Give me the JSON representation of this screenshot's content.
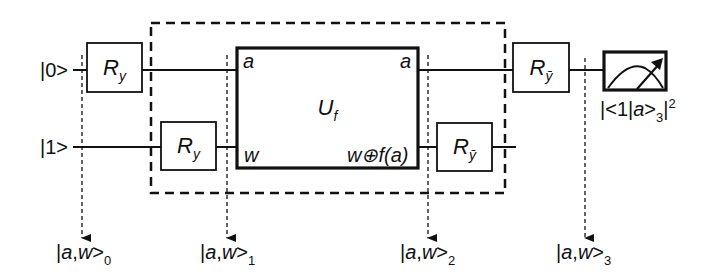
{
  "diagram": {
    "type": "quantum-circuit",
    "inputs": [
      {
        "id": "q0",
        "label": "|0>"
      },
      {
        "id": "q1",
        "label": "|1>"
      }
    ],
    "gates": {
      "ry_top": {
        "base": "R",
        "sub": "y"
      },
      "ry_bottom": {
        "base": "R",
        "sub": "y"
      },
      "uf": {
        "base": "U",
        "sub": "f",
        "in_top": "a",
        "in_bottom": "w",
        "out_top": "a",
        "out_bottom": "w⊕f(a)"
      },
      "rybar_bottom": {
        "base": "R",
        "sub": "ȳ"
      },
      "rybar_top": {
        "base": "R",
        "sub": "ȳ"
      }
    },
    "measurement": {
      "icon": "meter-icon",
      "label_prefix": "|<1|",
      "label_var": "a",
      "label_ket": ">",
      "label_sub": "3",
      "label_tail": "|",
      "label_sup": "2"
    },
    "state_markers": [
      {
        "prefix": "|",
        "var1": "a",
        "sep": ",",
        "var2": "w",
        "ket": ">",
        "sub": "0"
      },
      {
        "prefix": "|",
        "var1": "a",
        "sep": ",",
        "var2": "w",
        "ket": ">",
        "sub": "1"
      },
      {
        "prefix": "|",
        "var1": "a",
        "sep": ",",
        "var2": "w",
        "ket": ">",
        "sub": "2"
      },
      {
        "prefix": "|",
        "var1": "a",
        "sep": ",",
        "var2": "w",
        "ket": ">",
        "sub": "3"
      }
    ],
    "colors": {
      "line": "#111111",
      "background": "#ffffff"
    }
  }
}
